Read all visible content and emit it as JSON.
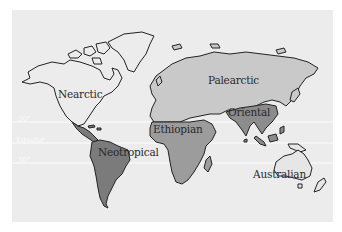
{
  "map": {
    "title": "Zoogeographic regions of the world",
    "background_color": "#ececec",
    "regions": [
      {
        "name": "Nearctic",
        "label": "Nearctic",
        "fill": "#ececec"
      },
      {
        "name": "Palearctic",
        "label": "Palearctic",
        "fill": "#c9c9c9"
      },
      {
        "name": "Ethiopian",
        "label": "Ethiopian",
        "fill": "#9c9c9c"
      },
      {
        "name": "Oriental",
        "label": "Oriental",
        "fill": "#8c8c8c"
      },
      {
        "name": "Neotropical",
        "label": "Neotropical",
        "fill": "#7b7b7b"
      },
      {
        "name": "Australian",
        "label": "Australian",
        "fill": "#e6e6e6"
      }
    ],
    "latitude_lines": [
      {
        "label": "30°",
        "y": 122
      },
      {
        "label": "Equator",
        "y": 143
      },
      {
        "label": "30°",
        "y": 163
      }
    ]
  }
}
